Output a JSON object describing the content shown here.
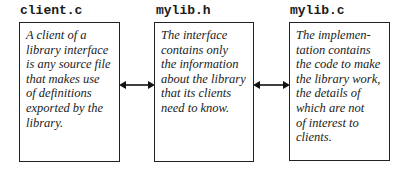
{
  "diagram": {
    "nodes": [
      {
        "label": "client.c",
        "text": "A client of a\nlibrary interface\nis any source file\nthat makes use\nof definitions\nexported by the\nlibrary."
      },
      {
        "label": "mylib.h",
        "text": "The interface\ncontains only\nthe information\nabout the library\nthat its clients\nneed to know."
      },
      {
        "label": "mylib.c",
        "text": "The implemen-\ntation contains\nthe code to make\nthe library work,\nthe details of\nwhich are not\nof interest to\nclients."
      }
    ],
    "edges": [
      {
        "from": "client.c",
        "to": "mylib.h",
        "type": "bidirectional-arrow"
      },
      {
        "from": "mylib.h",
        "to": "mylib.c",
        "type": "bidirectional-arrow"
      }
    ],
    "colors": {
      "stroke": "#222222",
      "background": "#ffffff"
    }
  }
}
